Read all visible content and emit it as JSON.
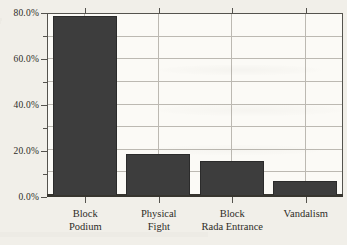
{
  "figure": {
    "kind": "scanned-book-figure",
    "background_color": "#f1efe9",
    "plot_background_color": "#fbfaf6",
    "grid_color": "#bcb9b2",
    "frame_color": "#55534e",
    "bar_color": "#3d3d3d",
    "text_color": "#2e2c27"
  },
  "chart_data": {
    "type": "bar",
    "title": "",
    "xlabel": "",
    "ylabel": "",
    "unit": "%",
    "categories": [
      "Block Podium",
      "Physical Fight",
      "Block Rada Entrance",
      "Vandalism"
    ],
    "category_label_lines": [
      [
        "Block",
        "Podium"
      ],
      [
        "Physical",
        "Fight"
      ],
      [
        "Block",
        "Rada Entrance"
      ],
      [
        "Vandalism"
      ]
    ],
    "values": [
      79,
      18,
      15,
      6
    ],
    "ylim": [
      0,
      80
    ],
    "ytick_values": [
      0,
      20,
      40,
      60,
      80
    ],
    "ytick_labels": [
      "0.0%",
      "20.0%",
      "40.0%",
      "60.0%",
      "80.0%"
    ],
    "minor_tick_values": [
      10,
      30,
      50,
      70
    ],
    "grid": "horizontal every 10%, vertical at category centers",
    "legend": "none"
  }
}
